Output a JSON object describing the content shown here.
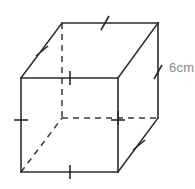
{
  "figure": {
    "type": "cube-net-3d-drawing",
    "shape_name": "cube",
    "canvas": {
      "width": 195,
      "height": 189,
      "background": "#ffffff"
    },
    "colors": {
      "edge_visible": "#2b2b2b",
      "edge_hidden": "#3a3a3a",
      "tick": "#2b2b2b",
      "label_text": "#8a8a8a",
      "face": "#ffffff"
    },
    "vertices": {
      "front_top_left": [
        21,
        78
      ],
      "front_top_right": [
        118,
        78
      ],
      "front_bottom_right": [
        118,
        172
      ],
      "front_bottom_left": [
        21,
        172
      ],
      "back_top_left": [
        62,
        23
      ],
      "back_top_right": [
        158,
        23
      ],
      "back_bottom_right": [
        158,
        118
      ],
      "back_bottom_left": [
        62,
        118
      ]
    },
    "visible_edges": [
      {
        "name": "front-top",
        "from": [
          21,
          78
        ],
        "to": [
          118,
          78
        ]
      },
      {
        "name": "front-right",
        "from": [
          118,
          78
        ],
        "to": [
          118,
          172
        ]
      },
      {
        "name": "front-bottom",
        "from": [
          21,
          172
        ],
        "to": [
          118,
          172
        ]
      },
      {
        "name": "front-left",
        "from": [
          21,
          78
        ],
        "to": [
          21,
          172
        ]
      },
      {
        "name": "back-top",
        "from": [
          62,
          23
        ],
        "to": [
          158,
          23
        ]
      },
      {
        "name": "back-right-vertical",
        "from": [
          158,
          23
        ],
        "to": [
          158,
          118
        ]
      },
      {
        "name": "top-left-diagonal",
        "from": [
          21,
          78
        ],
        "to": [
          62,
          23
        ]
      },
      {
        "name": "top-right-diagonal",
        "from": [
          118,
          78
        ],
        "to": [
          158,
          23
        ]
      },
      {
        "name": "bottom-right-diagonal",
        "from": [
          118,
          172
        ],
        "to": [
          158,
          118
        ]
      }
    ],
    "hidden_edges": [
      {
        "name": "back-left-vertical",
        "from": [
          62,
          23
        ],
        "to": [
          62,
          118
        ]
      },
      {
        "name": "back-bottom",
        "from": [
          62,
          118
        ],
        "to": [
          158,
          118
        ]
      },
      {
        "name": "bottom-left-diagonal",
        "from": [
          21,
          172
        ],
        "to": [
          62,
          118
        ]
      }
    ],
    "tick_marks": [
      {
        "name": "tick-front-top",
        "cx": 70,
        "cy": 78,
        "angle": 90
      },
      {
        "name": "tick-front-bottom",
        "cx": 70,
        "cy": 172,
        "angle": 90
      },
      {
        "name": "tick-front-left",
        "cx": 21,
        "cy": 120,
        "angle": 0
      },
      {
        "name": "tick-front-right",
        "cx": 118,
        "cy": 120,
        "angle": 0
      },
      {
        "name": "tick-back-bottom",
        "cx": 118,
        "cy": 118,
        "angle": 90
      },
      {
        "name": "tick-back-top",
        "cx": 105,
        "cy": 23,
        "angle": 62
      },
      {
        "name": "tick-top-left-diagonal",
        "cx": 42,
        "cy": 51,
        "angle": 35
      },
      {
        "name": "tick-bottom-right-diagonal",
        "cx": 139,
        "cy": 145,
        "angle": 35
      },
      {
        "name": "tick-back-right-vertical",
        "cx": 158,
        "cy": 72,
        "angle": 62
      }
    ],
    "labels": [
      {
        "name": "edge-length-label",
        "text": "6cm",
        "value": 6,
        "unit": "cm",
        "x": 169,
        "y": 61,
        "color": "#8a8a8a",
        "refers_to": "back-right-vertical"
      }
    ]
  }
}
